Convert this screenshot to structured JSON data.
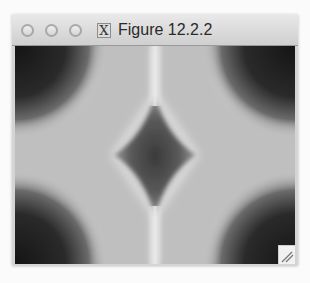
{
  "window": {
    "title": "Figure 12.2.2",
    "app_icon": "x11-icon",
    "app_icon_glyph": "X",
    "controls": [
      "close-button",
      "minimize-button",
      "zoom-button"
    ]
  },
  "figure": {
    "colormap": "gray",
    "colors": {
      "dark": "#1a1a1a",
      "mid": "#8a8a8a",
      "light": "#c8c8c8",
      "ridge": "#e6e6e6"
    }
  },
  "resize_grip": {
    "icon": "resize-grip-icon"
  }
}
